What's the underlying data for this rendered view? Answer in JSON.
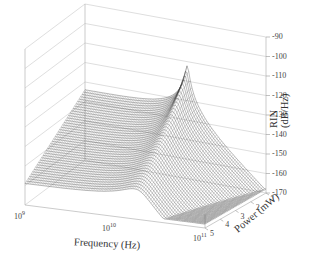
{
  "chart_data": {
    "type": "surface3d",
    "title": "",
    "xlabel": "Frequency (Hz)",
    "ylabel": "Power (mW)",
    "zlabel": "RIN (dB/Hz)",
    "x_scale": "log",
    "x_ticks": [
      "10^9",
      "10^10",
      "10^11"
    ],
    "x_range": [
      1000000000.0,
      100000000000.0
    ],
    "y_ticks": [
      1,
      2,
      3,
      4,
      5
    ],
    "y_range": [
      1,
      5
    ],
    "z_ticks": [
      -90,
      -100,
      -110,
      -120,
      -130,
      -140,
      -150,
      -160,
      -170
    ],
    "z_range": [
      -170,
      -90
    ],
    "grid": true,
    "legend": null,
    "series": [
      {
        "name": "P=1mW",
        "x": [
          1000000000.0,
          3000000000.0,
          10000000000.0,
          15000000000.0,
          30000000000.0,
          100000000000.0
        ],
        "values": [
          -140,
          -128,
          -110,
          -95,
          -118,
          -140
        ]
      },
      {
        "name": "P=3mW",
        "x": [
          1000000000.0,
          3000000000.0,
          10000000000.0,
          15000000000.0,
          30000000000.0,
          100000000000.0
        ],
        "values": [
          -152,
          -140,
          -122,
          -112,
          -125,
          -145
        ]
      },
      {
        "name": "P=5mW",
        "x": [
          1000000000.0,
          3000000000.0,
          10000000000.0,
          15000000000.0,
          30000000000.0,
          100000000000.0
        ],
        "values": [
          -165,
          -152,
          -135,
          -125,
          -132,
          -150
        ]
      }
    ]
  },
  "axes": {
    "x": {
      "label": "Frequency (Hz)",
      "ticks": [
        {
          "base": "10",
          "exp": "9"
        },
        {
          "base": "10",
          "exp": "10"
        },
        {
          "base": "10",
          "exp": "11"
        }
      ]
    },
    "y": {
      "label": "Power (mW)",
      "ticks": [
        "1",
        "2",
        "3",
        "4",
        "5"
      ]
    },
    "z": {
      "label": "RIN (dB/Hz)",
      "ticks": [
        "-90",
        "-100",
        "-110",
        "-120",
        "-130",
        "-140",
        "-150",
        "-160",
        "-170"
      ]
    }
  },
  "colors": {
    "wire": "#333333",
    "box": "#bbbbbb",
    "grid": "#cccccc",
    "text": "#333333"
  }
}
